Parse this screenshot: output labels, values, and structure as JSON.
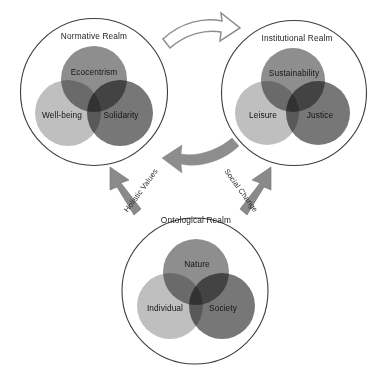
{
  "diagram": {
    "realms": [
      {
        "id": "normative",
        "title": "Normative Realm",
        "components": {
          "top": "Ecocentrism",
          "left": "Well-being",
          "right": "Solidarity"
        }
      },
      {
        "id": "institutional",
        "title": "Institutional Realm",
        "components": {
          "top": "Sustainability",
          "left": "Leisure",
          "right": "Justice"
        }
      },
      {
        "id": "ontological",
        "title": "Ontological Realm",
        "components": {
          "top": "Nature",
          "left": "Individual",
          "right": "Society"
        }
      }
    ],
    "flows": [
      {
        "id": "holistic-values",
        "label": "Holistic Values",
        "from": "ontological",
        "to": "normative",
        "style": "straight-arrow"
      },
      {
        "id": "social-change",
        "label": "Social Change",
        "from": "ontological",
        "to": "institutional",
        "style": "straight-arrow"
      },
      {
        "id": "normative-to-institutional",
        "label": "",
        "from": "normative",
        "to": "institutional",
        "style": "curved-outline-arrow"
      },
      {
        "id": "institutional-to-normative",
        "label": "",
        "from": "institutional",
        "to": "normative",
        "style": "curved-solid-arrow"
      }
    ],
    "colors": {
      "background": "#ffffff",
      "outline": "#3d3d3d",
      "venn_top": "#8e8e8e",
      "venn_left": "#bfbfbf",
      "venn_right": "#777777",
      "arrow_gray": "#8d8d8d",
      "text": "#151515"
    }
  }
}
